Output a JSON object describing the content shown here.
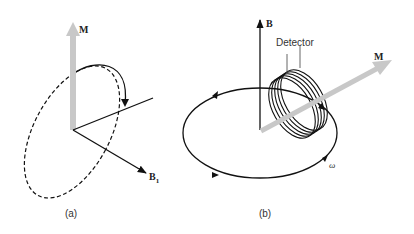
{
  "panels": [
    {
      "id": "a",
      "caption": "(a)",
      "labels": {
        "magnetization": "M",
        "field": "B",
        "field_subscript": "1"
      },
      "description": "Magnetization vector M tipped by RF field B1; dashed ellipse shows precession path with solid arc and arrowhead"
    },
    {
      "id": "b",
      "caption": "(b)",
      "labels": {
        "field": "B",
        "magnetization": "M",
        "detector": "Detector",
        "angular_frequency": "ω"
      },
      "description": "Magnetization M precessing about static field B at angular frequency ω, inducing signal in detector coil"
    }
  ],
  "colors": {
    "line": "#111111",
    "magnetization_arrow": "#c8c8c8",
    "background": "#ffffff"
  }
}
